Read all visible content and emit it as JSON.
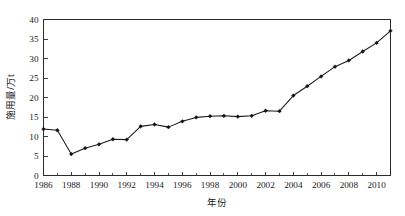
{
  "chart_data": {
    "type": "line",
    "title": "",
    "xlabel": "年份",
    "ylabel": "施用量/万t",
    "xlim": [
      1986,
      2011
    ],
    "ylim": [
      0,
      40
    ],
    "grid": false,
    "legend": null,
    "y_ticks": [
      0,
      5,
      10,
      15,
      20,
      25,
      30,
      35,
      40
    ],
    "y_tick_labels": [
      "0",
      "5",
      "10",
      "15",
      "20",
      "25",
      "30",
      "35",
      "40"
    ],
    "x_ticks": [
      1986,
      1988,
      1990,
      1992,
      1994,
      1996,
      1998,
      2000,
      2002,
      2004,
      2006,
      2008,
      2010
    ],
    "x_tick_labels": [
      "1986",
      "1988",
      "1990",
      "1992",
      "1994",
      "1996",
      "1998",
      "2000",
      "2002",
      "2004",
      "2006",
      "2008",
      "2010"
    ],
    "x_minor_ticks": [
      1987,
      1989,
      1991,
      1993,
      1995,
      1997,
      1999,
      2001,
      2003,
      2005,
      2007,
      2009,
      2011
    ],
    "marker": "filled-diamond",
    "line_color": "#1a1a1a",
    "marker_color": "#111111",
    "x": [
      1986,
      1987,
      1988,
      1989,
      1990,
      1991,
      1992,
      1993,
      1994,
      1995,
      1996,
      1997,
      1998,
      1999,
      2000,
      2001,
      2002,
      2003,
      2004,
      2005,
      2006,
      2007,
      2008,
      2009,
      2010,
      2011
    ],
    "values": [
      11.9,
      11.6,
      5.5,
      7.0,
      8.0,
      9.3,
      9.2,
      12.6,
      13.1,
      12.4,
      13.9,
      14.9,
      15.2,
      15.3,
      15.1,
      15.3,
      16.6,
      16.5,
      20.5,
      22.9,
      25.4,
      27.9,
      29.5,
      31.8,
      34.0,
      37.1
    ],
    "series": [
      {
        "name": "施用量",
        "values": [
          11.9,
          11.6,
          5.5,
          7.0,
          8.0,
          9.3,
          9.2,
          12.6,
          13.1,
          12.4,
          13.9,
          14.9,
          15.2,
          15.3,
          15.1,
          15.3,
          16.6,
          16.5,
          20.5,
          22.9,
          25.4,
          27.9,
          29.5,
          31.8,
          34.0,
          37.1
        ]
      }
    ]
  },
  "axes": {
    "y_title": "施用量/万t",
    "x_title": "年份"
  }
}
